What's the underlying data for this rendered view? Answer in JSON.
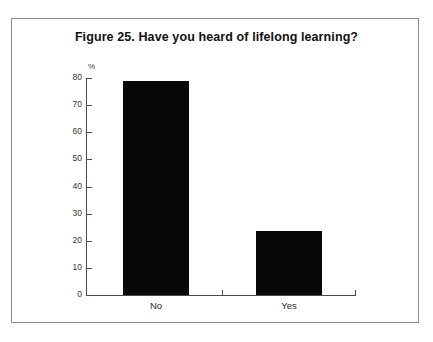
{
  "figure": {
    "title": "Figure 25. Have you heard of lifelong learning?",
    "unit_label": "%",
    "bar_color": "#080808",
    "axis_color": "#4a4a4a",
    "frame_color": "#8b8b8b"
  },
  "chart_data": {
    "type": "bar",
    "title": "Figure 25. Have you heard of lifelong learning?",
    "categories": [
      "No",
      "Yes"
    ],
    "values": [
      79,
      23.5
    ],
    "xlabel": "",
    "ylabel": "%",
    "ylim": [
      0,
      80
    ],
    "yticks": [
      0,
      10,
      20,
      30,
      40,
      50,
      60,
      70,
      80
    ],
    "ytick_labels": [
      "0",
      "10",
      "20",
      "30",
      "40",
      "50",
      "60",
      "70",
      "80"
    ],
    "grid": false,
    "legend": false
  }
}
